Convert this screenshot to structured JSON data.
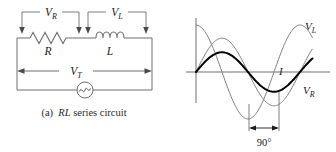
{
  "figure": {
    "caption_prefix": "(a)",
    "caption_italic": "RL",
    "caption_rest": "series circuit",
    "caption_full": "(a)  RL series circuit"
  },
  "circuit": {
    "name": "RL series circuit",
    "components": [
      {
        "id": "resistor",
        "symbol": "zigzag",
        "label": "R",
        "label_italic": true
      },
      {
        "id": "inductor",
        "symbol": "coil",
        "label": "L",
        "label_italic": true,
        "coils": 4
      },
      {
        "id": "ac-source",
        "symbol": "sine-in-circle",
        "label": ""
      }
    ],
    "measurements": [
      {
        "id": "v-r",
        "label_main": "V",
        "label_sub": "R",
        "across": "resistor",
        "style": "bracket-down-arrows"
      },
      {
        "id": "v-l",
        "label_main": "V",
        "label_sub": "L",
        "across": "inductor",
        "style": "bracket-down-arrows"
      },
      {
        "id": "v-t",
        "label_main": "V",
        "label_sub": "T",
        "across": "source",
        "style": "double-headed-arrow"
      }
    ]
  },
  "waveform": {
    "axes": {
      "x_axis": true,
      "y_axis": true,
      "tick_labels": [],
      "grid": false
    },
    "annotation": {
      "phase_label": "90°",
      "arrow": "double-headed"
    },
    "curve_labels": [
      {
        "id": "v-l-curve",
        "label_main": "V",
        "label_sub": "L"
      },
      {
        "id": "v-r-curve",
        "label_main": "V",
        "label_sub": "R"
      },
      {
        "id": "i-curve",
        "label_main": "I",
        "label_sub": ""
      }
    ]
  },
  "chart_data": {
    "type": "line",
    "title": "",
    "xlabel": "",
    "ylabel": "",
    "xlim": [
      0,
      1.25
    ],
    "ylim": [
      -1.15,
      1.15
    ],
    "grid": false,
    "legend_position": "inline-right",
    "annotations": [
      {
        "text": "90°",
        "type": "phase-shift-span",
        "from_x": 0.75,
        "to_x": 1.0
      }
    ],
    "x": [
      0,
      0.0625,
      0.125,
      0.1875,
      0.25,
      0.3125,
      0.375,
      0.4375,
      0.5,
      0.5625,
      0.625,
      0.6875,
      0.75,
      0.8125,
      0.875,
      0.9375,
      1.0,
      1.0625,
      1.125,
      1.1875,
      1.25
    ],
    "series": [
      {
        "name": "V_L",
        "label": "VL",
        "phase_deg": 90,
        "amplitude": 1.0,
        "stroke": "#808080",
        "width": 1,
        "values": [
          1.0,
          0.924,
          0.707,
          0.383,
          0.0,
          -0.383,
          -0.707,
          -0.924,
          -1.0,
          -0.924,
          -0.707,
          -0.383,
          0.0,
          0.383,
          0.707,
          0.924,
          1.0,
          0.924,
          0.707,
          0.383,
          0.0
        ]
      },
      {
        "name": "V_R",
        "label": "VR",
        "phase_deg": 0,
        "amplitude": 0.72,
        "stroke": "#808080",
        "width": 1,
        "values": [
          0.0,
          0.276,
          0.509,
          0.665,
          0.72,
          0.665,
          0.509,
          0.276,
          0.0,
          -0.276,
          -0.509,
          -0.665,
          -0.72,
          -0.665,
          -0.509,
          -0.276,
          0.0,
          0.276,
          0.509,
          0.665,
          0.72
        ]
      },
      {
        "name": "I",
        "label": "I",
        "phase_deg": 0,
        "amplitude": 0.42,
        "stroke": "#000000",
        "width": 2,
        "values": [
          0.0,
          0.161,
          0.297,
          0.388,
          0.42,
          0.388,
          0.297,
          0.161,
          0.0,
          -0.161,
          -0.297,
          -0.388,
          -0.42,
          -0.388,
          -0.297,
          -0.161,
          0.0,
          0.161,
          0.297,
          0.388,
          0.42
        ]
      }
    ]
  },
  "colors": {
    "ink": "#000000",
    "wire": "#6f6f6f",
    "curve_light": "#8a8a8a",
    "curve_bold": "#000000",
    "background": "#ffffff"
  }
}
